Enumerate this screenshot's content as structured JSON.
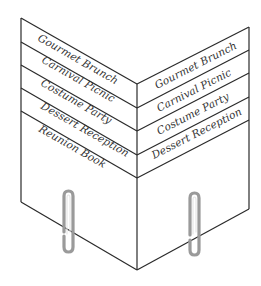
{
  "diagram": {
    "title": "",
    "left_panel": {
      "tabs": [
        {
          "label": "Gourmet Brunch"
        },
        {
          "label": "Carnival Picnic"
        },
        {
          "label": "Costume Party"
        },
        {
          "label": "Dessert Reception"
        },
        {
          "label": "Reunion Book"
        }
      ]
    },
    "right_panel": {
      "tabs": [
        {
          "label": "Gourmet Brunch"
        },
        {
          "label": "Carnival Picnic"
        },
        {
          "label": "Costume Party"
        },
        {
          "label": "Dessert Reception"
        }
      ]
    },
    "paper_clips": 2,
    "colors": {
      "line": "#2a2a2a",
      "text": "#333333",
      "clip": "#9a9a9a",
      "background": "#ffffff"
    }
  }
}
